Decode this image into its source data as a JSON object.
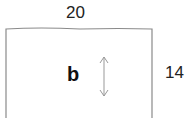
{
  "diagram": {
    "shape": "rectangle",
    "width_label": "20",
    "height_label": "14",
    "variable_label": "b",
    "arrow": "vertical-double-arrow",
    "colors": {
      "stroke": "#8a8a8a",
      "text": "#222222"
    }
  }
}
